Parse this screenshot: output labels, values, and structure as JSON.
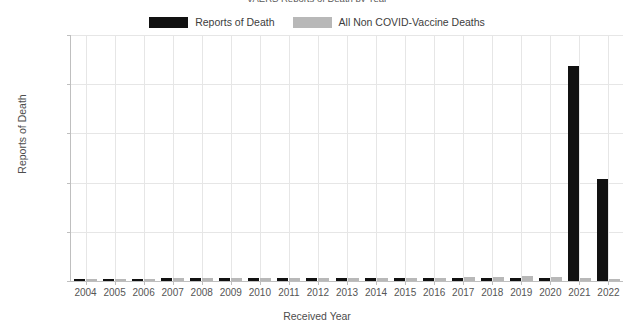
{
  "chart_data": {
    "type": "bar",
    "title": "VAERS Reports of Death by Year",
    "xlabel": "Received Year",
    "ylabel": "Reports of Death",
    "categories": [
      "2004",
      "2005",
      "2006",
      "2007",
      "2008",
      "2009",
      "2010",
      "2011",
      "2012",
      "2013",
      "2014",
      "2015",
      "2016",
      "2017",
      "2018",
      "2019",
      "2020",
      "2021",
      "2022"
    ],
    "series": [
      {
        "name": "Reports of Death",
        "color": "#111111",
        "values": [
          230,
          245,
          250,
          265,
          270,
          260,
          275,
          280,
          265,
          270,
          280,
          290,
          300,
          310,
          320,
          300,
          290,
          21900,
          10400
        ]
      },
      {
        "name": "All Non COVID-Vaccine Deaths",
        "color": "#b8b8b8",
        "values": [
          230,
          245,
          250,
          265,
          270,
          260,
          275,
          280,
          265,
          270,
          280,
          290,
          330,
          360,
          420,
          480,
          400,
          330,
          250
        ]
      }
    ],
    "ylim": [
      0,
      25000
    ],
    "yticks": [
      0,
      5000,
      10000,
      15000,
      20000,
      25000
    ],
    "ytick_labels": [
      "0",
      "5000",
      "10000",
      "15000",
      "20000",
      "25000"
    ],
    "grid": true,
    "legend_position": "top-center"
  }
}
